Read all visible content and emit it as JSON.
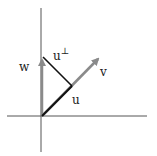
{
  "diagram": {
    "title": "",
    "colors": {
      "axis": "#555555",
      "gray_vector": "#8a8a8a",
      "black_vector": "#111111",
      "label": "#222222"
    },
    "labels": {
      "w": "w",
      "u_perp_base": "u",
      "u_perp_sup": "⊥",
      "v": "v",
      "u": "u"
    },
    "elements": [
      {
        "id": "x-axis",
        "type": "axis",
        "from": [
          7,
          116
        ],
        "to": [
          147,
          116
        ]
      },
      {
        "id": "y-axis",
        "type": "axis",
        "from": [
          41,
          8
        ],
        "to": [
          41,
          152
        ]
      },
      {
        "id": "w",
        "type": "vector",
        "color": "gray",
        "from": [
          42,
          116
        ],
        "to": [
          42,
          57
        ]
      },
      {
        "id": "v",
        "type": "vector",
        "color": "gray",
        "from": [
          42,
          116
        ],
        "to": [
          100,
          57
        ]
      },
      {
        "id": "u",
        "type": "segment",
        "color": "black",
        "from": [
          42,
          116
        ],
        "to": [
          72,
          86
        ]
      },
      {
        "id": "u-perp",
        "type": "segment",
        "color": "black",
        "from": [
          72,
          86
        ],
        "to": [
          43,
          57
        ]
      }
    ]
  }
}
